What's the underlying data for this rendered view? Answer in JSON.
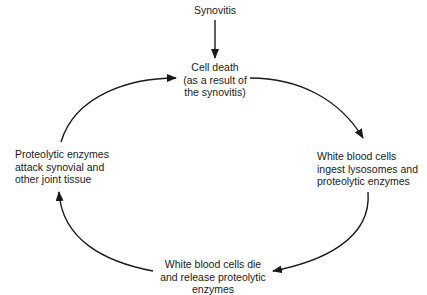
{
  "diagram": {
    "type": "cycle",
    "input_node": {
      "id": "synovitis",
      "label": "Synovitis"
    },
    "nodes": [
      {
        "id": "cell-death",
        "label": "Cell death\n(as a result of\nthe synovitis)"
      },
      {
        "id": "wbc-ingest",
        "label": "White blood cells\ningest lysosomes and\nproteolytic enzymes"
      },
      {
        "id": "wbc-die",
        "label": "White blood cells die\nand release proteolytic\nenzymes"
      },
      {
        "id": "enzymes-attack",
        "label": "Proteolytic enzymes\nattack synovial and\nother joint tissue"
      }
    ],
    "edges": [
      {
        "from": "synovitis",
        "to": "cell-death"
      },
      {
        "from": "cell-death",
        "to": "wbc-ingest"
      },
      {
        "from": "wbc-ingest",
        "to": "wbc-die"
      },
      {
        "from": "wbc-die",
        "to": "enzymes-attack"
      },
      {
        "from": "enzymes-attack",
        "to": "cell-death"
      }
    ],
    "colors": {
      "line": "#1a1a1a",
      "text": "#1a1a1a",
      "background": "#ffffff"
    }
  }
}
